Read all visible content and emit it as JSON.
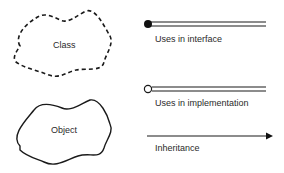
{
  "shapes": {
    "class": {
      "label": "Class",
      "style": "dashed-cloud"
    },
    "object": {
      "label": "Object",
      "style": "solid-cloud"
    }
  },
  "legend": {
    "uses_interface": {
      "label": "Uses in interface",
      "marker": "filled-circle",
      "line": "double"
    },
    "uses_implementation": {
      "label": "Uses in implementation",
      "marker": "open-circle",
      "line": "double"
    },
    "inheritance": {
      "label": "Inheritance",
      "marker": "arrowhead",
      "line": "single"
    }
  },
  "colors": {
    "stroke": "#1a1a1a",
    "text": "#2a2a2a",
    "background": "#ffffff"
  }
}
